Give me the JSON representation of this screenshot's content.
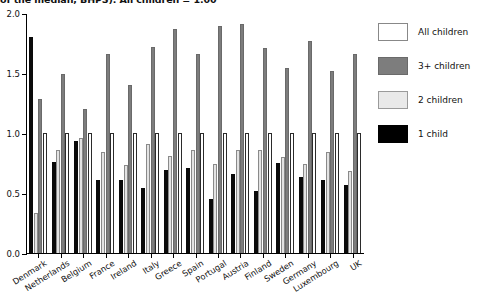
{
  "chart_data": {
    "type": "bar",
    "title": "of the median, BHPS). All children = 1.00",
    "xlabel": "",
    "ylabel": "",
    "ylim": [
      0.0,
      2.0
    ],
    "yticks": [
      0.0,
      0.5,
      1.0,
      1.5,
      2.0
    ],
    "ytick_labels": [
      "0.0",
      "0.5",
      "1.0",
      "1.5",
      "2.0"
    ],
    "grid": false,
    "legend_position": "right",
    "categories": [
      "Denmark",
      "Netherlands",
      "Belgium",
      "France",
      "Ireland",
      "Italy",
      "Greece",
      "Spain",
      "Portugal",
      "Austria",
      "Finland",
      "Sweden",
      "Germany",
      "Luxembourg",
      "UK"
    ],
    "series": [
      {
        "name": "1 child",
        "color": "#000000",
        "values": [
          1.8,
          0.76,
          0.93,
          0.61,
          0.61,
          0.54,
          0.69,
          0.71,
          0.45,
          0.66,
          0.52,
          0.75,
          0.63,
          0.61,
          0.57
        ]
      },
      {
        "name": "2 children",
        "color": "#e9e9e9",
        "values": [
          0.33,
          0.86,
          0.96,
          0.84,
          0.73,
          0.91,
          0.81,
          0.86,
          0.74,
          0.86,
          0.86,
          0.8,
          0.74,
          0.84,
          0.68
        ]
      },
      {
        "name": "3+ children",
        "color": "#7d7d7d",
        "values": [
          1.28,
          1.49,
          1.2,
          1.66,
          1.4,
          1.72,
          1.87,
          1.66,
          1.89,
          1.91,
          1.71,
          1.54,
          1.77,
          1.52,
          1.66
        ]
      },
      {
        "name": "All children",
        "color": "#ffffff",
        "values": [
          1.0,
          1.0,
          1.0,
          1.0,
          1.0,
          1.0,
          1.0,
          1.0,
          1.0,
          1.0,
          1.0,
          1.0,
          1.0,
          1.0,
          1.0
        ]
      }
    ]
  },
  "legend": {
    "items": [
      {
        "label": "All children",
        "key": "all"
      },
      {
        "label": "3+ children",
        "key": "three"
      },
      {
        "label": "2 children",
        "key": "two"
      },
      {
        "label": "1 child",
        "key": "one"
      }
    ]
  }
}
